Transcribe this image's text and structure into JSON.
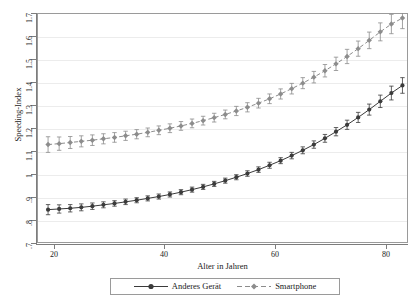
{
  "chart_data": {
    "type": "line",
    "title": "",
    "xlabel": "Alter in Jahren",
    "ylabel": "Speeding-Index",
    "xlim": [
      17,
      84
    ],
    "ylim": [
      0.7,
      1.7
    ],
    "grid": true,
    "legend_position": "bottom",
    "xticks": [
      20,
      40,
      60,
      80
    ],
    "xtick_labels": [
      "20",
      "40",
      "60",
      "80"
    ],
    "yticks": [
      0.7,
      0.8,
      0.9,
      1.0,
      1.1,
      1.2,
      1.3,
      1.4,
      1.5,
      1.6,
      1.7
    ],
    "ytick_labels": [
      ".7",
      ".8",
      ".9",
      "1",
      "1.1",
      "1.2",
      "1.3",
      "1.4",
      "1.5",
      "1.6",
      "1.7"
    ],
    "x": [
      19,
      21,
      23,
      25,
      27,
      29,
      31,
      33,
      35,
      37,
      39,
      41,
      43,
      45,
      47,
      49,
      51,
      53,
      55,
      57,
      59,
      61,
      63,
      65,
      67,
      69,
      71,
      73,
      75,
      77,
      79,
      81,
      83
    ],
    "series": [
      {
        "name": "Anderes Gerät",
        "color": "#3b3b3b",
        "linestyle": "solid",
        "marker": "circle",
        "values": [
          0.845,
          0.848,
          0.851,
          0.855,
          0.86,
          0.866,
          0.872,
          0.879,
          0.886,
          0.894,
          0.902,
          0.911,
          0.921,
          0.932,
          0.944,
          0.957,
          0.971,
          0.986,
          1.002,
          1.019,
          1.038,
          1.058,
          1.08,
          1.103,
          1.128,
          1.155,
          1.184,
          1.214,
          1.246,
          1.28,
          1.316,
          1.352,
          1.385
        ],
        "err": [
          0.022,
          0.018,
          0.016,
          0.015,
          0.014,
          0.013,
          0.012,
          0.012,
          0.011,
          0.011,
          0.011,
          0.011,
          0.011,
          0.011,
          0.011,
          0.011,
          0.011,
          0.011,
          0.012,
          0.012,
          0.013,
          0.013,
          0.014,
          0.015,
          0.016,
          0.017,
          0.018,
          0.02,
          0.022,
          0.024,
          0.027,
          0.03,
          0.034
        ]
      },
      {
        "name": "Smartphone",
        "color": "#8c8c8c",
        "linestyle": "dashed",
        "marker": "diamond",
        "values": [
          1.128,
          1.132,
          1.137,
          1.142,
          1.147,
          1.153,
          1.159,
          1.166,
          1.173,
          1.181,
          1.19,
          1.199,
          1.209,
          1.22,
          1.232,
          1.245,
          1.259,
          1.274,
          1.29,
          1.308,
          1.327,
          1.348,
          1.371,
          1.395,
          1.421,
          1.449,
          1.479,
          1.511,
          1.545,
          1.581,
          1.618,
          1.652,
          1.678
        ],
        "err": [
          0.034,
          0.029,
          0.026,
          0.024,
          0.023,
          0.022,
          0.021,
          0.02,
          0.02,
          0.019,
          0.019,
          0.019,
          0.019,
          0.019,
          0.019,
          0.019,
          0.019,
          0.02,
          0.02,
          0.021,
          0.021,
          0.022,
          0.023,
          0.024,
          0.025,
          0.027,
          0.029,
          0.031,
          0.033,
          0.036,
          0.039,
          0.042,
          0.046
        ]
      }
    ]
  },
  "axes": {
    "y_title": "Speeding-Index",
    "x_title": "Alter in Jahren"
  },
  "legend": {
    "items": [
      {
        "label": "Anderes Gerät"
      },
      {
        "label": "Smartphone"
      }
    ]
  }
}
